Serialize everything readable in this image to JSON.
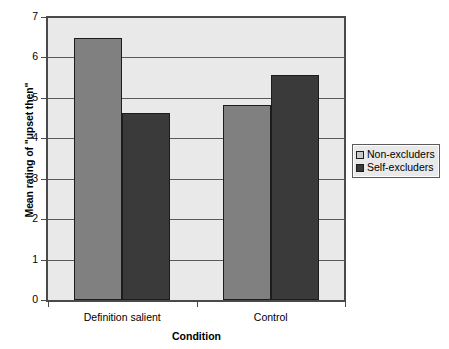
{
  "chart_data": {
    "type": "bar",
    "title": "",
    "xlabel": "Condition",
    "ylabel": "Mean rating of \"upset then\"",
    "categories": [
      "Definition salient",
      "Control"
    ],
    "series": [
      {
        "name": "Non-excluders",
        "values": [
          6.48,
          4.82
        ],
        "color": "#808080"
      },
      {
        "name": "Self-excluders",
        "values": [
          4.62,
          5.56
        ],
        "color": "#3a3a3a"
      }
    ],
    "ylim": [
      0,
      7
    ],
    "ytick_labels": [
      "0",
      "1",
      "2",
      "3",
      "4",
      "5",
      "6",
      "7"
    ],
    "ytick_values": [
      0,
      1,
      2,
      3,
      4,
      5,
      6,
      7
    ],
    "grid": true,
    "legend_position": "right",
    "plot_background": "#e9e9e9",
    "axis_color": "#4a4a4a"
  },
  "legend": {
    "entries": [
      {
        "label": "Non-excluders"
      },
      {
        "label": "Self-excluders"
      }
    ]
  },
  "axes": {
    "y_title": "Mean rating of \"upset then\"",
    "x_title": "Condition",
    "y_ticks": [
      "7",
      "6",
      "5",
      "4",
      "3",
      "2",
      "1",
      "0"
    ],
    "x_categories": [
      "Definition salient",
      "Control"
    ]
  }
}
